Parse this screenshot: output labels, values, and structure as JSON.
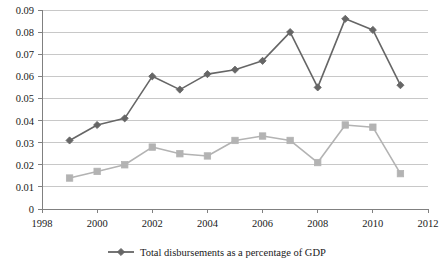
{
  "chart_data": {
    "type": "line",
    "title": "",
    "subtitle": "",
    "xlabel": "",
    "ylabel": "",
    "x": [
      1999,
      2000,
      2001,
      2002,
      2003,
      2004,
      2005,
      2006,
      2007,
      2008,
      2009,
      2010,
      2011
    ],
    "xlim": [
      1998,
      2012
    ],
    "ylim": [
      0,
      0.09
    ],
    "grid": true,
    "grid_axis": "y",
    "legend_position": "bottom-center",
    "x_ticks": [
      1998,
      2000,
      2002,
      2004,
      2006,
      2008,
      2010,
      2012
    ],
    "x_tick_labels": [
      "1998",
      "2000",
      "2002",
      "2004",
      "2006",
      "2008",
      "2010",
      "2012"
    ],
    "y_ticks": [
      0,
      0.01,
      0.02,
      0.03,
      0.04,
      0.05,
      0.06,
      0.07,
      0.08,
      0.09
    ],
    "y_tick_labels": [
      "0",
      "0.01",
      "0.02",
      "0.03",
      "0.04",
      "0.05",
      "0.06",
      "0.07",
      "0.08",
      "0.09"
    ],
    "series": [
      {
        "name": "Total disbursements as a percentage of GDP",
        "color": "#666666",
        "marker": "diamond",
        "in_legend": true,
        "values": [
          0.031,
          0.038,
          0.041,
          0.06,
          0.054,
          0.061,
          0.063,
          0.067,
          0.08,
          0.055,
          0.086,
          0.081,
          0.056
        ]
      },
      {
        "name": "",
        "color": "#b3b3b3",
        "marker": "square",
        "in_legend": false,
        "values": [
          0.014,
          0.017,
          0.02,
          0.028,
          0.025,
          0.024,
          0.031,
          0.033,
          0.031,
          0.021,
          0.038,
          0.037,
          0.016
        ]
      }
    ],
    "legend_entries": [
      {
        "label": "Total disbursements as a percentage of GDP",
        "color": "#666666",
        "marker": "diamond"
      }
    ]
  },
  "colors": {
    "series_primary": "#666666",
    "series_secondary": "#b3b3b3",
    "gridline": "#c8c8c8",
    "axis": "#808080",
    "text": "#1a1a1a",
    "background": "#ffffff"
  }
}
